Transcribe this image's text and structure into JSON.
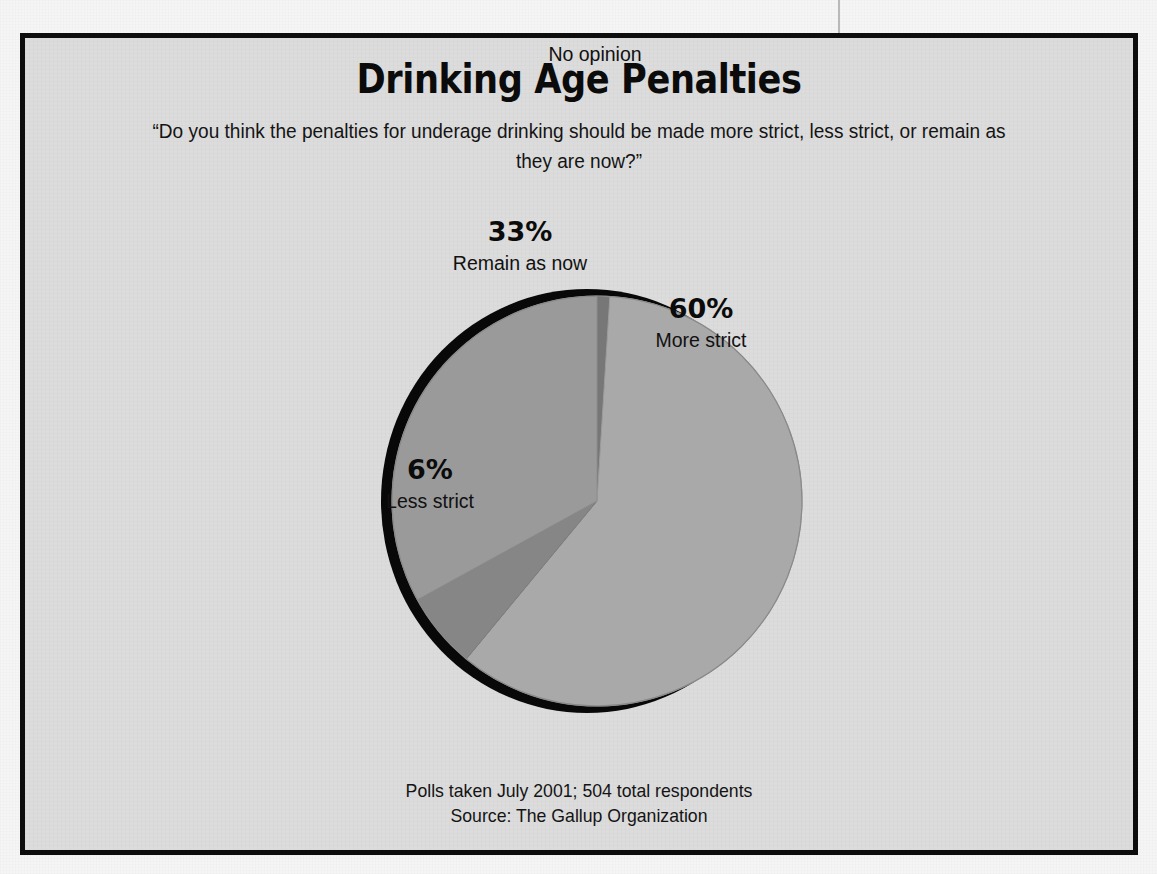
{
  "chart_data": {
    "type": "pie",
    "title": "Drinking Age Penalties",
    "subtitle": "“Do you think the penalties for underage drinking should be made more strict, less strict, or remain as they are now?”",
    "categories": [
      "More strict",
      "Less strict",
      "Remain as now",
      "No opinion"
    ],
    "values": [
      60,
      6,
      33,
      1
    ],
    "value_labels": [
      "60%",
      "6%",
      "33%",
      "1%"
    ],
    "unit": "percent",
    "slice_colors": [
      "#a9a9a9",
      "#868686",
      "#9a9a9a",
      "#777777"
    ],
    "start_angle_deg": 0,
    "direction": "clockwise",
    "legend": "none",
    "labels_placement": "in-slice and outside callouts",
    "xlabel": "",
    "ylabel": "",
    "grid": false
  },
  "slices": [
    {
      "label": "More strict",
      "value": "60%",
      "category": "More strict",
      "color": "#a9a9a9"
    },
    {
      "label": "Less strict",
      "value": "6%",
      "category": "Less strict",
      "color": "#868686"
    },
    {
      "label": "Remain as now",
      "value": "33%",
      "category": "Remain as now",
      "color": "#9a9a9a"
    },
    {
      "label": "No opinion",
      "value": "1%",
      "category": "No opinion",
      "color": "#777777"
    }
  ],
  "footnote": {
    "line1": "Polls taken July 2001; 504 total respondents",
    "line2": "Source: The Gallup Organization"
  },
  "colors": {
    "frame_border": "#0d0d0d",
    "panel_background": "#dcdcdc",
    "page_background": "#f5f5f5",
    "pie_shadow": "#080808",
    "text": "#0b0b0b"
  }
}
